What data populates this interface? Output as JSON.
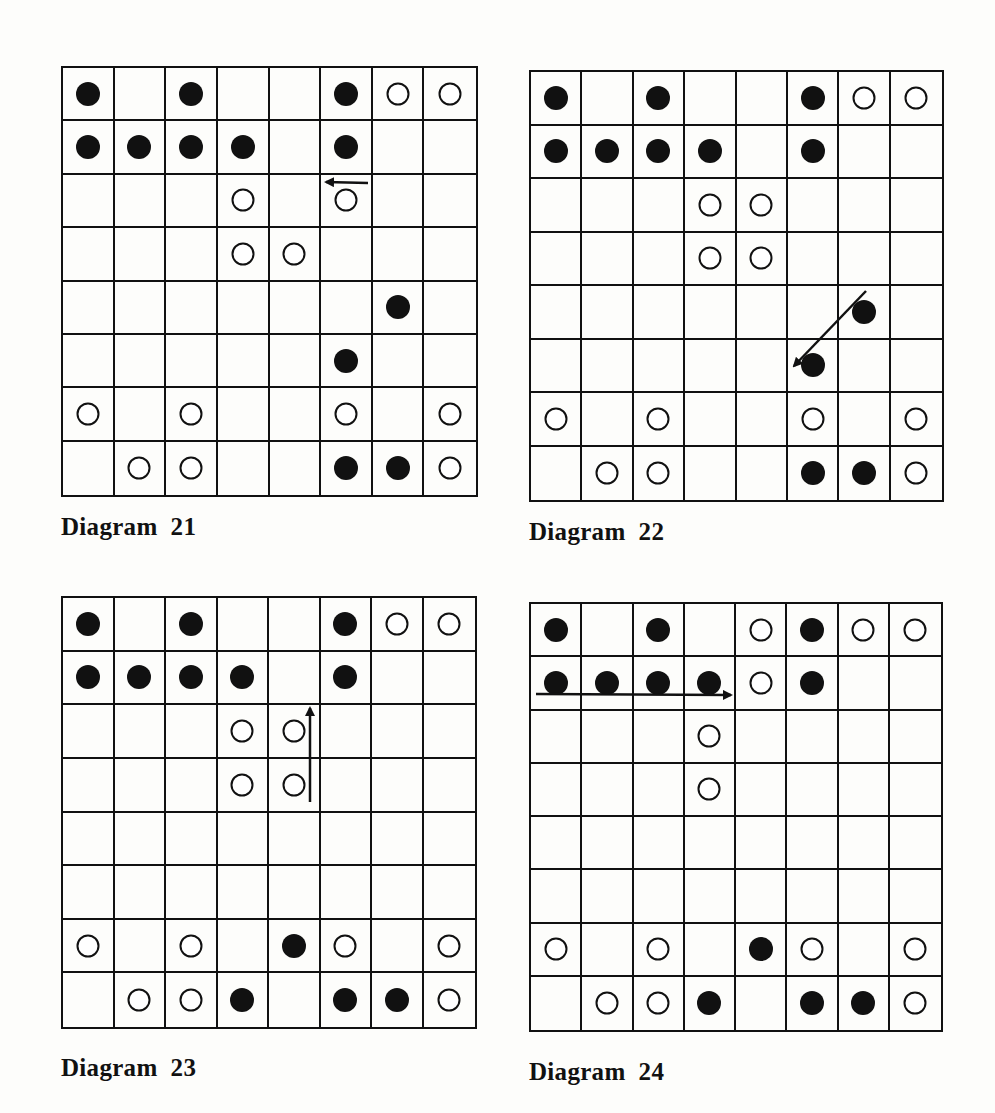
{
  "diagrams": [
    {
      "id": "21",
      "caption": "Diagram  21",
      "board": {
        "x": 61,
        "y": 66,
        "w": 417,
        "h": 431
      },
      "caption_pos": {
        "x": 61,
        "y": 513
      },
      "rows": [
        [
          "B",
          "",
          "B",
          "",
          "",
          "B",
          "W",
          "W"
        ],
        [
          "B",
          "B",
          "B",
          "B",
          "",
          "B",
          "",
          ""
        ],
        [
          "",
          "",
          "",
          "W",
          "",
          "W",
          "",
          ""
        ],
        [
          "",
          "",
          "",
          "W",
          "W",
          "",
          "",
          ""
        ],
        [
          "",
          "",
          "",
          "",
          "",
          "",
          "B",
          ""
        ],
        [
          "",
          "",
          "",
          "",
          "",
          "B",
          "",
          ""
        ],
        [
          "W",
          "",
          "W",
          "",
          "",
          "W",
          "",
          "W"
        ],
        [
          "",
          "W",
          "W",
          "",
          "",
          "B",
          "B",
          "W"
        ]
      ],
      "arrows": [
        {
          "x1": 368,
          "y1": 183,
          "x2": 326,
          "y2": 182
        }
      ]
    },
    {
      "id": "22",
      "caption": "Diagram  22",
      "board": {
        "x": 529,
        "y": 70,
        "w": 415,
        "h": 432
      },
      "caption_pos": {
        "x": 529,
        "y": 518
      },
      "rows": [
        [
          "B",
          "",
          "B",
          "",
          "",
          "B",
          "W",
          "W"
        ],
        [
          "B",
          "B",
          "B",
          "B",
          "",
          "B",
          "",
          ""
        ],
        [
          "",
          "",
          "",
          "W",
          "W",
          "",
          "",
          ""
        ],
        [
          "",
          "",
          "",
          "W",
          "W",
          "",
          "",
          ""
        ],
        [
          "",
          "",
          "",
          "",
          "",
          "",
          "B",
          ""
        ],
        [
          "",
          "",
          "",
          "",
          "",
          "B",
          "",
          ""
        ],
        [
          "W",
          "",
          "W",
          "",
          "",
          "W",
          "",
          "W"
        ],
        [
          "",
          "W",
          "W",
          "",
          "",
          "B",
          "B",
          "W"
        ]
      ],
      "arrows": [
        {
          "x1": 866,
          "y1": 291,
          "x2": 794,
          "y2": 366
        }
      ]
    },
    {
      "id": "23",
      "caption": "Diagram  23",
      "board": {
        "x": 61,
        "y": 596,
        "w": 416,
        "h": 433
      },
      "caption_pos": {
        "x": 61,
        "y": 1054
      },
      "rows": [
        [
          "B",
          "",
          "B",
          "",
          "",
          "B",
          "W",
          "W"
        ],
        [
          "B",
          "B",
          "B",
          "B",
          "",
          "B",
          "",
          ""
        ],
        [
          "",
          "",
          "",
          "W",
          "W",
          "",
          "",
          ""
        ],
        [
          "",
          "",
          "",
          "W",
          "W",
          "",
          "",
          ""
        ],
        [
          "",
          "",
          "",
          "",
          "",
          "",
          "",
          ""
        ],
        [
          "",
          "",
          "",
          "",
          "",
          "",
          "",
          ""
        ],
        [
          "W",
          "",
          "W",
          "",
          "B",
          "W",
          "",
          "W"
        ],
        [
          "",
          "W",
          "W",
          "B",
          "",
          "B",
          "B",
          "W"
        ]
      ],
      "arrows": [
        {
          "x1": 310,
          "y1": 802,
          "x2": 310,
          "y2": 708
        }
      ]
    },
    {
      "id": "24",
      "caption": "Diagram  24",
      "board": {
        "x": 529,
        "y": 602,
        "w": 414,
        "h": 430
      },
      "caption_pos": {
        "x": 529,
        "y": 1058
      },
      "rows": [
        [
          "B",
          "",
          "B",
          "",
          "W",
          "B",
          "W",
          "W"
        ],
        [
          "B",
          "B",
          "B",
          "B",
          "W",
          "B",
          "",
          ""
        ],
        [
          "",
          "",
          "",
          "W",
          "",
          "",
          "",
          ""
        ],
        [
          "",
          "",
          "",
          "W",
          "",
          "",
          "",
          ""
        ],
        [
          "",
          "",
          "",
          "",
          "",
          "",
          "",
          ""
        ],
        [
          "",
          "",
          "",
          "",
          "",
          "",
          "",
          ""
        ],
        [
          "W",
          "",
          "W",
          "",
          "B",
          "W",
          "",
          "W"
        ],
        [
          "",
          "W",
          "W",
          "B",
          "",
          "B",
          "B",
          "W"
        ]
      ],
      "arrows": [
        {
          "x1": 536,
          "y1": 694,
          "x2": 731,
          "y2": 695
        }
      ]
    }
  ],
  "legend": {
    "B": "black-piece",
    "W": "white-piece"
  }
}
